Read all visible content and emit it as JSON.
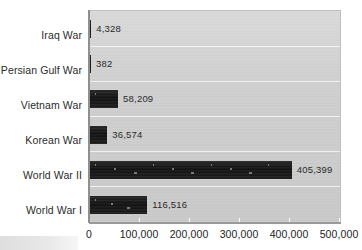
{
  "chart_data": {
    "type": "bar",
    "orientation": "horizontal",
    "title": "",
    "subtitle": "",
    "xlabel": "",
    "ylabel": "",
    "categories": [
      "Iraq War",
      "Persian Gulf War",
      "Vietnam War",
      "Korean War",
      "World War II",
      "World War I"
    ],
    "values": [
      4328,
      382,
      58209,
      36574,
      405399,
      116516
    ],
    "value_labels": [
      "4,328",
      "382",
      "58,209",
      "36,574",
      "405,399",
      "116,516"
    ],
    "xlim": [
      0,
      500000
    ],
    "xticks": [
      0,
      100000,
      200000,
      300000,
      400000,
      500000
    ],
    "xtick_labels": [
      "0",
      "100,000",
      "200,000",
      "300,000",
      "400,000",
      "500,000"
    ],
    "grid": true,
    "grid_axis": "y",
    "legend": false,
    "legend_position": "none",
    "bar_color": "#1a1a1a",
    "plot_background_color": "#cfcfcf",
    "page_background_color": "#ffffff",
    "text_color": "#222222"
  }
}
